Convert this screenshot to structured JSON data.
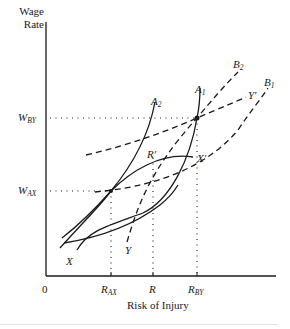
{
  "figure": {
    "y_axis_label_line1": "Wage",
    "y_axis_label_line2": "Rate",
    "x_axis_label": "Risk of Injury",
    "origin_label": "0",
    "y_ticks": [
      {
        "main": "W",
        "sub": "BY"
      },
      {
        "main": "W",
        "sub": "AX"
      }
    ],
    "x_ticks": [
      {
        "main": "R",
        "sub": "AX"
      },
      {
        "main": "R",
        "sub": ""
      },
      {
        "main": "R",
        "sub": "BY"
      }
    ],
    "curve_labels": {
      "A1": {
        "main": "A",
        "sub": "1"
      },
      "A2": {
        "main": "A",
        "sub": "2"
      },
      "B1": {
        "main": "B",
        "sub": "1"
      },
      "B2": {
        "main": "B",
        "sub": "2"
      },
      "X": "X",
      "X_prime": "X′",
      "Y": "Y",
      "Y_prime": "Y′",
      "R_prime": "R′"
    },
    "colors": {
      "ink": "#1a1a1a",
      "rule": "#e2e2e2"
    }
  }
}
